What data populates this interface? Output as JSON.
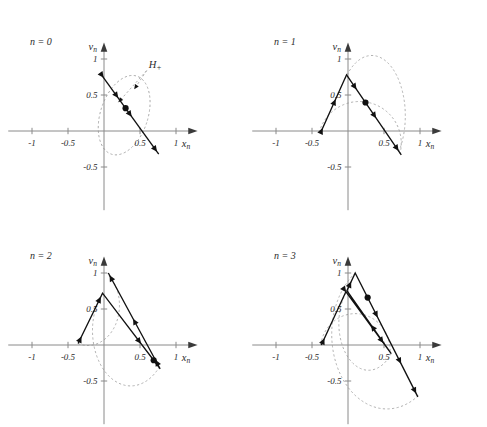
{
  "figure": {
    "axis_labels": {
      "x": "x",
      "x_sub": "n",
      "y": "v",
      "y_sub": "n"
    },
    "annotation": {
      "label": "H",
      "sub": "+"
    },
    "colors": {
      "orbit": "#111111",
      "axis": "#8a8a8a",
      "guide": "#a8a8a8",
      "text": "#2b2b2b",
      "background": "#ffffff"
    }
  },
  "chart_data": {
    "type": "line",
    "title": "",
    "xlabel": "x_n",
    "ylabel": "v_n",
    "xlim": [
      -1.25,
      1.25
    ],
    "ylim": [
      -0.85,
      1.2
    ],
    "grid": false,
    "legend_position": "none",
    "panels": [
      {
        "label": "n = 0",
        "xticks": [
          -1,
          -0.5,
          0.5,
          1
        ],
        "xtick_labels": [
          "-1",
          "-0.5",
          "0.5",
          "1"
        ],
        "yticks": [
          -0.5,
          0.5,
          1
        ],
        "ytick_labels": [
          "-0.5",
          "0.5",
          "1"
        ],
        "annotation": {
          "text": "H+",
          "x": 0.62,
          "y": 0.88
        },
        "annotation_leader_to": [
          [
            0.2,
            0.4
          ],
          [
            0.42,
            0.58
          ]
        ],
        "series": [
          {
            "name": "initial-segment",
            "points": [
              [
                -0.02,
                0.76
              ],
              [
                0.76,
                -0.32
              ]
            ],
            "arrows_at": [
              0.02,
              0.28,
              0.52,
              0.97
            ],
            "dot_at": 0.41
          }
        ],
        "guides": [
          {
            "name": "ellipse-H-plus",
            "cx": 0.28,
            "cy": 0.22,
            "rx": 0.33,
            "ry": 0.57,
            "rot": -18
          }
        ]
      },
      {
        "label": "n = 1",
        "xticks": [
          -1,
          -0.5,
          0.5,
          1
        ],
        "xtick_labels": [
          "-1",
          "-0.5",
          "0.5",
          "1"
        ],
        "yticks": [
          -0.5,
          0.5,
          1
        ],
        "ytick_labels": [
          "-0.5",
          "0.5",
          "1"
        ],
        "series": [
          {
            "name": "folded-segment",
            "points": [
              [
                -0.37,
                0.0
              ],
              [
                -0.02,
                0.78
              ],
              [
                0.74,
                -0.33
              ]
            ],
            "arrows_at": [
              0.02,
              0.22,
              0.5,
              0.72,
              0.97
            ],
            "dot_at": 0.6
          }
        ],
        "guides": [
          {
            "name": "arc-lower",
            "path": "M -0.40 -0.02 A 0.42 0.42 0 0 0 0.72 -0.32"
          },
          {
            "name": "arc-inner",
            "path": "M -0.04 0.72 A 0.40 0.72 0 0 0 0.70 -0.30"
          }
        ]
      },
      {
        "label": "n = 2",
        "xticks": [
          -1,
          -0.5,
          0.5,
          1
        ],
        "xtick_labels": [
          "-1",
          "-0.5",
          "0.5",
          "1"
        ],
        "yticks": [
          -0.5,
          0.5,
          1
        ],
        "ytick_labels": [
          "-0.5",
          "0.5",
          "1"
        ],
        "series": [
          {
            "name": "folded-segment-2",
            "points": [
              [
                -0.36,
                0.02
              ],
              [
                -0.02,
                0.72
              ],
              [
                0.78,
                -0.33
              ],
              [
                0.06,
                1.0
              ]
            ],
            "arrows_at": [
              0.03,
              0.2,
              0.46,
              0.62,
              0.8,
              0.99
            ],
            "dot_at": 0.54
          }
        ],
        "guides": [
          {
            "name": "arc-left-upper",
            "path": "M -0.36 0.02 A 0.44 0.56 0 0 1 0.04 1.0"
          },
          {
            "name": "arc-right-lower",
            "path": "M -0.02 0.72 A 0.40 0.58 0 0 1 0.76 -0.32"
          }
        ]
      },
      {
        "label": "n = 3",
        "xticks": [
          -1,
          -0.5,
          0.5,
          1
        ],
        "xtick_labels": [
          "-1",
          "-0.5",
          "0.5",
          "1"
        ],
        "yticks": [
          -0.5,
          0.5,
          1
        ],
        "ytick_labels": [
          "-0.5",
          "0.5",
          "1"
        ],
        "series": [
          {
            "name": "folded-segment-3",
            "points": [
              [
                -0.37,
                0.0
              ],
              [
                -0.03,
                0.74
              ],
              [
                0.6,
                -0.12
              ],
              [
                -0.015,
                0.755
              ],
              [
                0.1,
                1.0
              ],
              [
                0.97,
                -0.72
              ]
            ],
            "arrows_at": [
              0.02,
              0.16,
              0.33,
              0.46,
              0.6,
              0.76,
              0.9,
              0.99
            ],
            "dot_at": 0.7
          }
        ],
        "guides": [
          {
            "name": "arc-outer-right",
            "path": "M 0.10 1.0 A 0.62 0.84 0 0 1 0.98 -0.70"
          },
          {
            "name": "arc-lower-left",
            "path": "M -0.38 0.0 A 0.46 0.48 0 0 0 0.58 -0.14"
          },
          {
            "name": "arc-inner-mid",
            "path": "M -0.03 0.72 A 0.38 0.60 0 0 1 0.60 -0.12"
          }
        ]
      }
    ]
  }
}
